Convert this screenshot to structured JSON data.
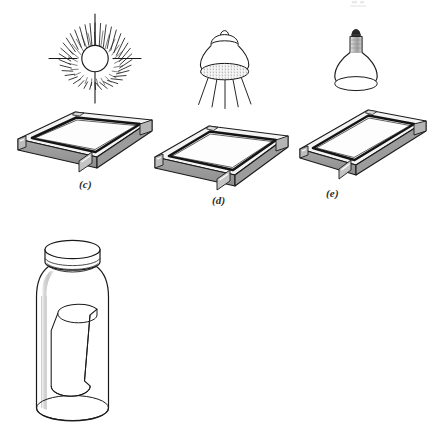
{
  "figure": {
    "background_color": "#ffffff",
    "line_color": "#1a1a1a",
    "panels": [
      {
        "id": "c",
        "label": "(c)",
        "light_source": "sunburst-sun",
        "light_source_description": "Radiating sun with many tapered rays and open circular core",
        "ray_count": 48,
        "long_ray_count": 4,
        "object": "screen-printing-frame",
        "frame_orientation": "square, long edge toward viewer"
      },
      {
        "id": "d",
        "label": "(d)",
        "light_source": "dome-flood-lamp",
        "light_source_description": "Bell shaped hanging lamp with stippled diffuser disc and five light beams",
        "beam_count": 5,
        "object": "screen-printing-frame",
        "frame_orientation": "square, rotated slightly"
      },
      {
        "id": "e",
        "label": "(e)",
        "light_source": "reflector-bulb",
        "light_source_description": "Photoflood reflector bulb with shaded screw base and dark contact tip",
        "object": "screen-printing-frame",
        "frame_orientation": "narrow rectangle"
      }
    ],
    "jar": {
      "name": "storage-jar",
      "description": "Clear glass jar with screw lid containing a loosely rolled sheet",
      "has_lid": true,
      "contents": "rolled-sheet"
    },
    "colors": {
      "outline": "#1a1a1a",
      "frame_top": "#f2f2f2",
      "frame_side": "#9a9a9a",
      "frame_side_dark": "#8a8a8a",
      "frame_inner_dark": "#141414",
      "glass_shade": "#c9c9c9",
      "lamp_base_shade": "#a8a8a8",
      "stipple": "#8f8f8f",
      "label_text": "#2b2b2b"
    }
  }
}
